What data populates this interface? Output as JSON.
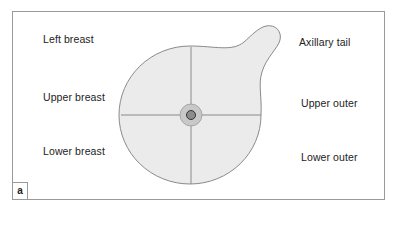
{
  "figure": {
    "panel_label": "a",
    "labels": {
      "left_breast": "Left breast",
      "upper_breast": "Upper breast",
      "lower_breast": "Lower breast",
      "axillary_tail": "Axillary tail",
      "upper_outer": "Upper outer",
      "lower_outer": "Lower outer"
    },
    "colors": {
      "breast_fill": "#ebebeb",
      "outline": "#8a8a8a",
      "areola": "#c8c8c8",
      "nipple": "#8c8c8c"
    }
  }
}
